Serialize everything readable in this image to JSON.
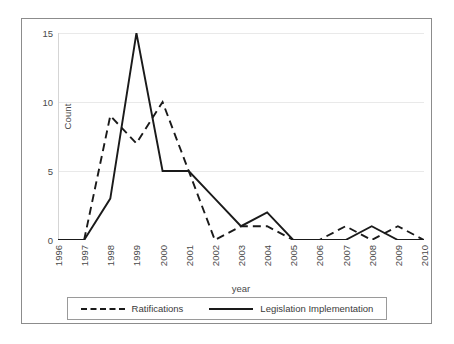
{
  "chart_data": {
    "type": "line",
    "title": "",
    "xlabel": "year",
    "ylabel": "Count",
    "categories": [
      "1996",
      "1997",
      "1998",
      "1999",
      "2000",
      "2001",
      "2002",
      "2003",
      "2004",
      "2005",
      "2006",
      "2007",
      "2008",
      "2009",
      "2010"
    ],
    "x": [
      1996,
      1997,
      1998,
      1999,
      2000,
      2001,
      2002,
      2003,
      2004,
      2005,
      2006,
      2007,
      2008,
      2009,
      2010
    ],
    "xlim": [
      1996,
      2010
    ],
    "ylim": [
      0,
      15
    ],
    "yticks": [
      0,
      5,
      10,
      15
    ],
    "ytick_labels": [
      "0",
      "5",
      "10",
      "15"
    ],
    "grid": "horizontal",
    "legend_position": "bottom",
    "series": [
      {
        "name": "Ratifications",
        "style": "dashed",
        "color": "#1a1a1a",
        "values": [
          0,
          0,
          9,
          7,
          10,
          5,
          0,
          1,
          1,
          0,
          0,
          1,
          0,
          1,
          0
        ]
      },
      {
        "name": "Legislation Implementation",
        "style": "solid",
        "color": "#1a1a1a",
        "values": [
          0,
          0,
          3,
          15,
          5,
          5,
          3,
          1,
          2,
          0,
          0,
          0,
          1,
          0,
          0
        ]
      }
    ]
  },
  "legend": {
    "entries": [
      {
        "label": "Ratifications",
        "style": "dashed"
      },
      {
        "label": "Legislation Implementation",
        "style": "solid"
      }
    ]
  },
  "axes": {
    "y_label": "Count",
    "x_label": "year"
  }
}
